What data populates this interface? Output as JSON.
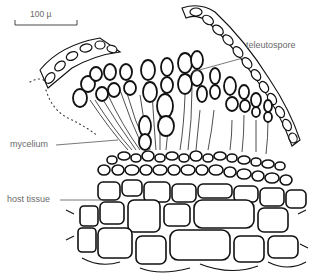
{
  "figure": {
    "scale_bar": {
      "label": "100 µ"
    },
    "labels": [
      {
        "id": "teleutospore",
        "text": "teleutospore"
      },
      {
        "id": "mycelium",
        "text": "mycelium"
      },
      {
        "id": "host-tissue",
        "text": "host tissue"
      }
    ],
    "colors": {
      "ink": "#111111",
      "label_text": "#6a6a6a",
      "background": "#ffffff"
    }
  }
}
